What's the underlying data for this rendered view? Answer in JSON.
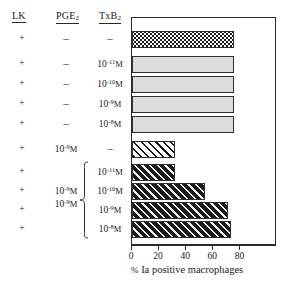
{
  "figure": {
    "columns": [
      {
        "key": "lk",
        "header": "LK",
        "sub": ""
      },
      {
        "key": "pge",
        "header": "PGE",
        "sub": "2"
      },
      {
        "key": "txb",
        "header": "TxB",
        "sub": "2"
      }
    ],
    "dash": "–",
    "molar_unit": "M"
  },
  "rows": [
    {
      "lk": "+",
      "pge": "–",
      "pge_exp": "",
      "txb": "–",
      "txb_exp": "",
      "value": 75,
      "fill": "stipple"
    },
    {
      "lk": "+",
      "pge": "–",
      "pge_exp": "",
      "txb": "10",
      "txb_exp": "-11",
      "value": 75,
      "fill": "gray"
    },
    {
      "lk": "+",
      "pge": "–",
      "pge_exp": "",
      "txb": "10",
      "txb_exp": "-10",
      "value": 75,
      "fill": "gray"
    },
    {
      "lk": "+",
      "pge": "–",
      "pge_exp": "",
      "txb": "10",
      "txb_exp": "-9",
      "value": 75,
      "fill": "gray"
    },
    {
      "lk": "+",
      "pge": "–",
      "pge_exp": "",
      "txb": "10",
      "txb_exp": "-8",
      "value": 75,
      "fill": "gray"
    },
    {
      "lk": "+",
      "pge": "10",
      "pge_exp": "-9",
      "txb": "–",
      "txb_exp": "",
      "value": 32,
      "fill": "hatch-light"
    },
    {
      "lk": "+",
      "pge": "",
      "pge_exp": "",
      "txb": "10",
      "txb_exp": "-11",
      "value": 32,
      "fill": "hatch-dark"
    },
    {
      "lk": "+",
      "pge": "10",
      "pge_exp": "-9",
      "txb": "10",
      "txb_exp": "-10",
      "value": 54,
      "fill": "hatch-dark"
    },
    {
      "lk": "+",
      "pge": "",
      "pge_exp": "",
      "txb": "10",
      "txb_exp": "-9",
      "value": 71,
      "fill": "hatch-dark"
    },
    {
      "lk": "+",
      "pge": "",
      "pge_exp": "",
      "txb": "10",
      "txb_exp": "-8",
      "value": 73,
      "fill": "hatch-dark"
    }
  ],
  "axis": {
    "label_pct": "%",
    "label_text": " Ia positive macrophages",
    "ticks": [
      0,
      20,
      40,
      60,
      80
    ],
    "min": 0,
    "max": 107
  },
  "chart_data": {
    "type": "bar",
    "orientation": "horizontal",
    "title": "",
    "xlabel": "% Ia positive macrophages",
    "ylabel": "",
    "xlim": [
      0,
      107
    ],
    "xticks": [
      0,
      20,
      40,
      60,
      80
    ],
    "grid": false,
    "legend": "none",
    "categories": [
      "LK + / PGE2 – / TxB2 –",
      "LK + / PGE2 – / TxB2 10-11M",
      "LK + / PGE2 – / TxB2 10-10M",
      "LK + / PGE2 – / TxB2 10-9M",
      "LK + / PGE2 – / TxB2 10-8M",
      "LK + / PGE2 10-9M / TxB2 –",
      "LK + / PGE2 10-9M / TxB2 10-11M",
      "LK + / PGE2 10-9M / TxB2 10-10M",
      "LK + / PGE2 10-9M / TxB2 10-9M",
      "LK + / PGE2 10-9M / TxB2 10-8M"
    ],
    "values": [
      75,
      75,
      75,
      75,
      75,
      32,
      32,
      54,
      71,
      73
    ],
    "fills": [
      "stipple",
      "gray",
      "gray",
      "gray",
      "gray",
      "hatch-light",
      "hatch-dark",
      "hatch-dark",
      "hatch-dark",
      "hatch-dark"
    ]
  },
  "colors": {
    "stroke": "#2b2b2b",
    "gray_fill": "#dcdcdc",
    "dark_fill": "#1a1a1a",
    "text": "#1a1a1a"
  }
}
